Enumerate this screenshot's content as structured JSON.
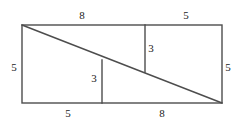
{
  "figure": {
    "type": "geometry-diagram",
    "stroke_color": "#4d4d4d",
    "background_color": "#ffffff",
    "label_color": "#1a1a1a",
    "rectangle": {
      "left": 22,
      "top": 25,
      "right": 222,
      "bottom": 103,
      "width": 200,
      "height": 78
    },
    "diagonal": {
      "x1": 22,
      "y1": 25,
      "x2": 222,
      "y2": 103
    },
    "segments": [
      {
        "name": "left-interior-vertical",
        "x1": 102,
        "y1": 60,
        "x2": 102,
        "y2": 103
      },
      {
        "name": "right-interior-vertical",
        "x1": 145,
        "y1": 25,
        "x2": 145,
        "y2": 72
      }
    ],
    "labels": [
      {
        "name": "top-left-length",
        "text": "8",
        "x": 82,
        "y": 15
      },
      {
        "name": "top-right-length",
        "text": "5",
        "x": 186,
        "y": 15
      },
      {
        "name": "left-side-height",
        "text": "5",
        "x": 14,
        "y": 67
      },
      {
        "name": "right-side-height",
        "text": "5",
        "x": 228,
        "y": 67
      },
      {
        "name": "bottom-left-length",
        "text": "5",
        "x": 68,
        "y": 113
      },
      {
        "name": "bottom-right-length",
        "text": "8",
        "x": 162,
        "y": 113
      },
      {
        "name": "left-interior-height",
        "text": "3",
        "x": 94,
        "y": 78
      },
      {
        "name": "right-interior-height",
        "text": "3",
        "x": 151,
        "y": 48
      }
    ]
  }
}
